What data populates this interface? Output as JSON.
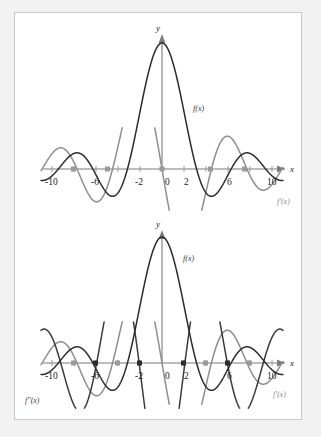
{
  "figure": {
    "background_color": "#ffffff",
    "page_color": "#f2f2f2",
    "border_color": "#c8c8c8"
  },
  "chart_data": [
    {
      "id": "top-panel",
      "type": "line",
      "title": "",
      "xlabel": "x",
      "ylabel": "y",
      "xlim": [
        -11.2,
        11.2
      ],
      "ylim": [
        -0.42,
        1.12
      ],
      "xticks": [
        -10,
        -8,
        -6,
        -4,
        -2,
        0,
        2,
        4,
        6,
        8,
        10
      ],
      "xtick_labels": [
        "-10",
        "",
        "-6",
        "",
        "-2",
        "0",
        "2",
        "",
        "6",
        "",
        "10"
      ],
      "grid": false,
      "legend_position": "inline-annotations",
      "series": [
        {
          "name": "f(x)",
          "label": "f(x)",
          "color": "#2b2b2b",
          "formula": "sin(x)/x",
          "description": "sinc function, peak value 1 at x = 0, zeros at multiples of pi"
        },
        {
          "name": "f'(x)",
          "label": "f'(x)",
          "color": "#8d8d8d",
          "formula": "derivative of sin(x)/x",
          "description": "cos(x)/x - sin(x)/x^2, scaled, zero at x = 0"
        }
      ],
      "annotations": [
        {
          "text": "f(x)",
          "x": 2.6,
          "y": 0.62
        },
        {
          "text": "f'(x)",
          "x": 10.6,
          "y": -0.36
        }
      ]
    },
    {
      "id": "bottom-panel",
      "type": "line",
      "title": "",
      "xlabel": "x",
      "ylabel": "y",
      "xlim": [
        -11.2,
        11.2
      ],
      "ylim": [
        -0.62,
        1.12
      ],
      "xticks": [
        -10,
        -8,
        -6,
        -4,
        -2,
        0,
        2,
        4,
        6,
        8,
        10
      ],
      "xtick_labels": [
        "-10",
        "",
        "-6",
        "",
        "-2",
        "0",
        "2",
        "",
        "6",
        "",
        "10"
      ],
      "grid": false,
      "legend_position": "inline-annotations",
      "series": [
        {
          "name": "f(x)",
          "label": "f(x)",
          "color": "#2b2b2b",
          "formula": "sin(x)/x",
          "description": "sinc function, peak value 1 at x = 0"
        },
        {
          "name": "f'(x)",
          "label": "f'(x)",
          "color": "#8d8d8d",
          "formula": "derivative of sin(x)/x",
          "description": "first derivative, scaled"
        },
        {
          "name": "f''(x)",
          "label": "f''(x)",
          "color": "#3a3a3a",
          "formula": "second derivative of sin(x)/x",
          "description": "second derivative, scaled"
        }
      ],
      "annotations": [
        {
          "text": "f(x)",
          "x": 2.0,
          "y": 0.8
        },
        {
          "text": "f'(x)",
          "x": 10.6,
          "y": -0.44
        },
        {
          "text": "f''(x)",
          "x": -10.4,
          "y": -0.5
        }
      ]
    }
  ],
  "labels": {
    "y_axis": "y",
    "x_axis": "x",
    "origin": "0",
    "tick_neg10": "-10",
    "tick_neg6": "-6",
    "tick_neg2": "-2",
    "tick_2": "2",
    "tick_6": "6",
    "tick_10": "10",
    "f": "f(x)",
    "f_prime": "f'(x)",
    "f_double_prime": "f''(x)"
  }
}
